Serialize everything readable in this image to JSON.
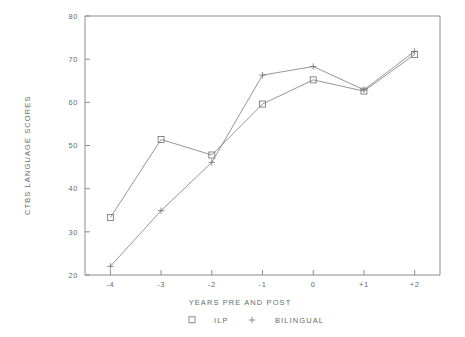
{
  "chart_data": {
    "type": "line",
    "title": "",
    "xlabel": "YEARS PRE AND POST",
    "ylabel": "CTBS LANGUAGE SCORES",
    "categories": [
      "-4",
      "-3",
      "-2",
      "-1",
      "0",
      "+1",
      "+2"
    ],
    "x": [
      -4,
      -3,
      -2,
      -1,
      0,
      1,
      2
    ],
    "xlim": [
      -4.5,
      2.5
    ],
    "ylim": [
      20,
      80
    ],
    "yticks": [
      20,
      30,
      40,
      50,
      60,
      70,
      80
    ],
    "ytick_labels": [
      "20",
      "30",
      "40",
      "50",
      "60",
      "70",
      "80"
    ],
    "xticks": [
      -4,
      -3,
      -2,
      -1,
      0,
      1,
      2
    ],
    "xtick_labels": [
      "-4",
      "-3",
      "-2",
      "-1",
      "0",
      "+1",
      "+2"
    ],
    "grid": false,
    "legend_position": "bottom",
    "series": [
      {
        "name": "ILP",
        "marker": "square",
        "values": [
          33.3,
          51.4,
          47.8,
          59.6,
          65.2,
          62.6,
          71.1
        ]
      },
      {
        "name": "BILINGUAL",
        "marker": "plus",
        "values": [
          22.0,
          34.9,
          46.1,
          66.3,
          68.3,
          62.9,
          71.8
        ]
      }
    ]
  },
  "legend": {
    "entries": [
      {
        "marker_icon": "square-marker-icon",
        "label": "ILP"
      },
      {
        "marker_icon": "plus-marker-icon",
        "label": "BILINGUAL"
      }
    ]
  },
  "colors": {
    "line": "#7a7a7a",
    "axis": "#8d8d8d",
    "text": "#6b6b6b",
    "background": "#ffffff"
  }
}
